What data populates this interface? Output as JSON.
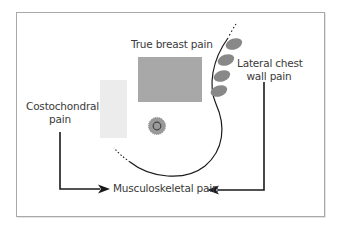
{
  "labels": {
    "true_breast_pain": "True breast pain",
    "lateral_chest_wall_line1": "Lateral chest",
    "lateral_chest_wall_line2": "wall pain",
    "costochondral_line1": "Costochondral",
    "costochondral_line2": "pain",
    "musculoskeletal": "Musculoskeletal pain"
  },
  "colors": {
    "frame_border": "#a9a9a9",
    "true_breast_region": "#a8a8a8",
    "costochondral_region": "#ececec",
    "lateral_ovals": "#888888",
    "nipple_areola": "#9a9a9a",
    "lines": "#1a1a1a",
    "text": "#3a3a3a"
  },
  "icons": {
    "arrow_left_to_right": "arrowhead-right",
    "arrow_right_to_left": "arrowhead-left",
    "nipple": "nipple-areola-circle"
  }
}
